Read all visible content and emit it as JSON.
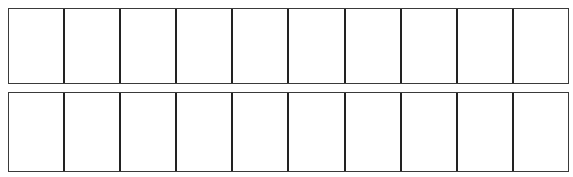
{
  "diagram": {
    "type": "empty-grid",
    "rows": [
      {
        "id": "top",
        "cell_count": 10,
        "cells": [
          "",
          "",
          "",
          "",
          "",
          "",
          "",
          "",
          "",
          ""
        ]
      },
      {
        "id": "bottom",
        "cell_count": 10,
        "cells": [
          "",
          "",
          "",
          "",
          "",
          "",
          "",
          "",
          "",
          ""
        ]
      }
    ],
    "colors": {
      "line": "#222222",
      "background": "#ffffff"
    }
  }
}
